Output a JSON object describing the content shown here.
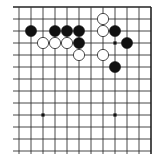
{
  "diagram": {
    "type": "go-board-fragment",
    "grid": {
      "origin_x": 19,
      "origin_y": 7,
      "spacing": 12,
      "columns": 12,
      "rows": 13,
      "left_stub_x": 13,
      "bottom_extend_y": 154,
      "edges": [
        "top",
        "right"
      ],
      "line_color": "#333333",
      "edge_color": "#222222"
    },
    "star_points": [
      {
        "col": 2,
        "row": 9
      },
      {
        "col": 8,
        "row": 9
      },
      {
        "col": 8,
        "row": 3
      }
    ],
    "stones": [
      {
        "color": "black",
        "col": 1,
        "row": 2
      },
      {
        "color": "black",
        "col": 3,
        "row": 2
      },
      {
        "color": "black",
        "col": 4,
        "row": 2
      },
      {
        "color": "black",
        "col": 5,
        "row": 2
      },
      {
        "color": "black",
        "col": 5,
        "row": 3
      },
      {
        "color": "black",
        "col": 8,
        "row": 2
      },
      {
        "color": "black",
        "col": 9,
        "row": 3
      },
      {
        "color": "black",
        "col": 8,
        "row": 5
      },
      {
        "color": "white",
        "col": 2,
        "row": 3
      },
      {
        "color": "white",
        "col": 3,
        "row": 3
      },
      {
        "color": "white",
        "col": 4,
        "row": 3
      },
      {
        "color": "white",
        "col": 5,
        "row": 4
      },
      {
        "color": "white",
        "col": 7,
        "row": 1
      },
      {
        "color": "white",
        "col": 7,
        "row": 2
      },
      {
        "color": "white",
        "col": 7,
        "row": 4
      }
    ],
    "colors": {
      "black_stone": "#111111",
      "white_stone_fill": "#ffffff",
      "white_stone_stroke": "#222222",
      "background": "#ffffff"
    }
  }
}
